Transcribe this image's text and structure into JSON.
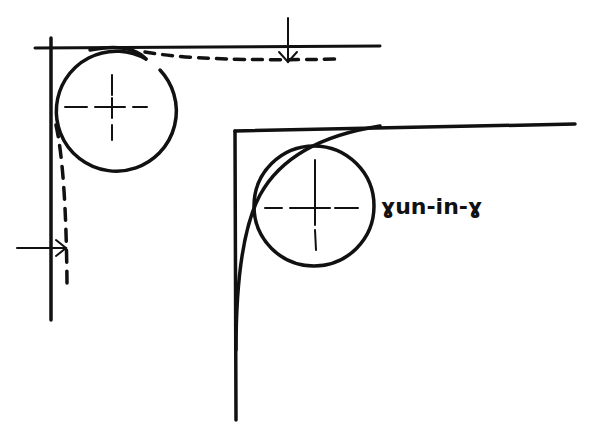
{
  "diagram": {
    "left_figure": {
      "description": "corner with tangent circle and dashed offset path, arrows",
      "circle": {
        "cx": 112,
        "cy": 107,
        "r": 60
      },
      "centerlines": true
    },
    "right_figure": {
      "description": "corner with circle and run-in radius curve",
      "circle": {
        "cx": 314,
        "cy": 206,
        "r": 60
      },
      "label": "ɣun-in-ɣ"
    },
    "colors": {
      "ink": "#111111",
      "background": "#ffffff"
    }
  }
}
